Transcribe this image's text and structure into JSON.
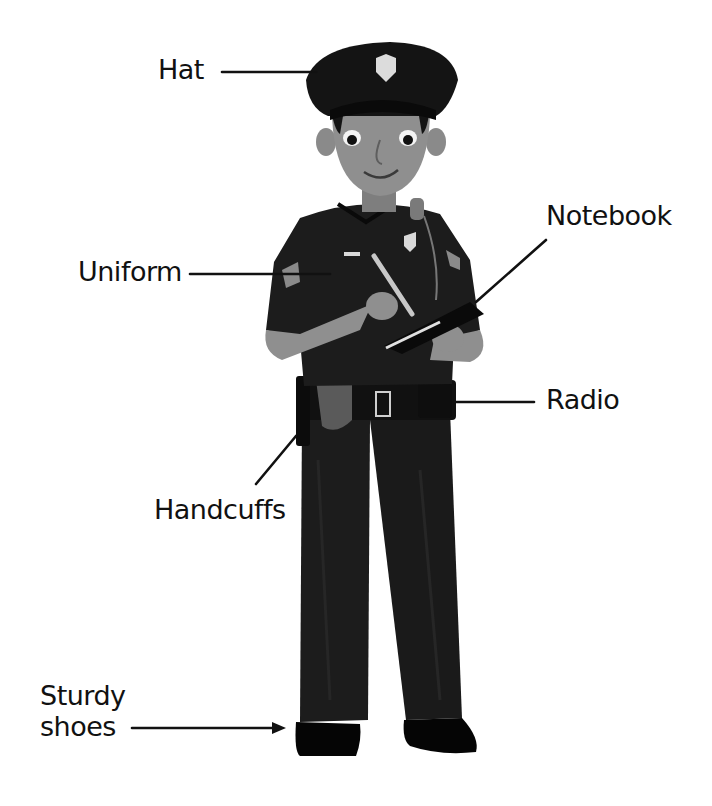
{
  "diagram": {
    "colors": {
      "background": "#ffffff",
      "text": "#111111",
      "uniform": "#1c1c1c",
      "uniform_shade": "#0f0f0f",
      "skin": "#8f8f8f",
      "skin_shade": "#6e6e6e",
      "hair": "#141414",
      "badge": "#d9d9d9",
      "holster": "#5a5a5a",
      "shoe": "#050505"
    },
    "labels": [
      {
        "id": "hat",
        "text": "Hat"
      },
      {
        "id": "uniform",
        "text": "Uniform"
      },
      {
        "id": "notebook",
        "text": "Notebook"
      },
      {
        "id": "radio",
        "text": "Radio"
      },
      {
        "id": "handcuffs",
        "text": "Handcuffs"
      },
      {
        "id": "shoes",
        "text": "Sturdy shoes"
      }
    ]
  }
}
